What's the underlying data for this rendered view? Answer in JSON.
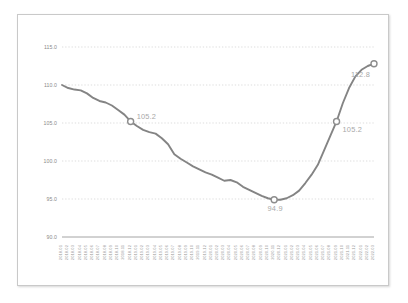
{
  "chart_data": {
    "type": "line",
    "title": "",
    "subtitle": "",
    "xlabel": "",
    "ylabel": "",
    "ylim": [
      90.0,
      115.0
    ],
    "ytick_labels": [
      "115.0",
      "110.0",
      "105.0",
      "100.0",
      "95.0",
      "90.0"
    ],
    "ytick_values": [
      115.0,
      110.0,
      105.0,
      100.0,
      95.0,
      90.0
    ],
    "grid": true,
    "legend": "none",
    "line_color": "#848484",
    "grid_color": "#cfcfcf",
    "axis_color": "#9a9a9a",
    "annotation_color": "#a8a8a8",
    "marker_fill": "#ffffff",
    "categories": [
      "2018.01",
      "2018.02",
      "2018.03",
      "2018.04",
      "2018.05",
      "2018.06",
      "2018.07",
      "2018.08",
      "2018.09",
      "2018.10",
      "2018.11",
      "2018.12",
      "2019.01",
      "2019.02",
      "2019.03",
      "2019.04",
      "2019.05",
      "2019.06",
      "2019.07",
      "2019.08",
      "2019.09",
      "2019.10",
      "2019.11",
      "2019.12",
      "2020.01",
      "2020.02",
      "2020.03",
      "2020.04",
      "2020.05",
      "2020.06",
      "2020.07",
      "2020.08",
      "2020.09",
      "2020.10",
      "2020.11",
      "2020.12",
      "2021.01",
      "2021.02",
      "2021.03",
      "2021.04",
      "2021.05",
      "2021.06",
      "2021.07",
      "2021.08",
      "2021.09",
      "2021.10",
      "2021.11",
      "2021.12",
      "2022.01",
      "2022.02",
      "2022.03"
    ],
    "values": [
      110.0,
      109.6,
      109.4,
      109.3,
      108.9,
      108.3,
      107.9,
      107.7,
      107.3,
      106.7,
      106.1,
      105.2,
      104.6,
      104.1,
      103.8,
      103.6,
      103.0,
      102.2,
      100.9,
      100.3,
      99.8,
      99.3,
      98.9,
      98.5,
      98.2,
      97.8,
      97.4,
      97.5,
      97.2,
      96.6,
      96.2,
      95.8,
      95.4,
      95.1,
      94.9,
      94.9,
      95.1,
      95.5,
      96.1,
      97.1,
      98.2,
      99.5,
      101.4,
      103.3,
      105.2,
      107.6,
      109.6,
      111.1,
      112.0,
      112.5,
      112.8
    ],
    "annotations": [
      {
        "label": "105.2",
        "index": 11,
        "value": 105.2
      },
      {
        "label": "94.9",
        "index": 34,
        "value": 94.9
      },
      {
        "label": "105.2",
        "index": 44,
        "value": 105.2
      },
      {
        "label": "112.8",
        "index": 50,
        "value": 112.8
      }
    ]
  }
}
